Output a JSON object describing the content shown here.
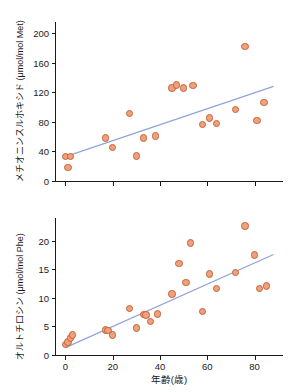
{
  "figure": {
    "background": "#ffffff",
    "marker_fill": "#f0a07a",
    "marker_edge": "#c4633a",
    "line_color": "#8fa5d8",
    "axis_color": "#1a1a1a"
  },
  "chart_data": [
    {
      "type": "scatter",
      "panel": "top",
      "title": "",
      "xlabel": "",
      "ylabel": "メチオニンスルホキシド (μmol/mol Met)",
      "xlim": [
        -4,
        92
      ],
      "ylim": [
        0,
        215
      ],
      "xticks": [
        0,
        20,
        40,
        60,
        80
      ],
      "xticklabels": [
        "",
        "",
        "",
        "",
        ""
      ],
      "yticks": [
        0,
        40,
        80,
        120,
        160,
        200
      ],
      "yticklabels": [
        "0",
        "40",
        "80",
        "120",
        "160",
        "200"
      ],
      "grid": false,
      "legend": "none",
      "x": [
        0,
        1,
        2,
        17,
        20,
        27,
        30,
        33,
        38,
        45,
        47,
        50,
        54,
        58,
        61,
        64,
        72,
        76,
        81,
        84
      ],
      "y": [
        33,
        18,
        33,
        58,
        45,
        91,
        34,
        58,
        61,
        126,
        130,
        126,
        129,
        76,
        85,
        78,
        97,
        182,
        82,
        106
      ],
      "fit_line": {
        "x": [
          0,
          88
        ],
        "y": [
          33,
          128
        ],
        "color": "#8fa5d8"
      }
    },
    {
      "type": "scatter",
      "panel": "bottom",
      "title": "",
      "xlabel": "年齢(歳)",
      "ylabel": "オルトチロシン (μmol/mol Phe)",
      "xlim": [
        -4,
        92
      ],
      "ylim": [
        0,
        24
      ],
      "xticks": [
        0,
        20,
        40,
        60,
        80
      ],
      "xticklabels": [
        "0",
        "20",
        "40",
        "60",
        "80"
      ],
      "yticks": [
        0,
        5,
        10,
        15,
        20
      ],
      "yticklabels": [
        "0",
        "5",
        "10",
        "15",
        "20"
      ],
      "grid": false,
      "legend": "none",
      "x": [
        0,
        1,
        2,
        3,
        17,
        18,
        20,
        27,
        30,
        33,
        34,
        36,
        39,
        45,
        48,
        51,
        53,
        58,
        61,
        64,
        72,
        76,
        80,
        82,
        85
      ],
      "y": [
        1.8,
        2.3,
        3.0,
        3.5,
        4.4,
        4.3,
        3.5,
        8.2,
        4.7,
        7.1,
        7.0,
        5.9,
        7.2,
        10.7,
        16.0,
        12.7,
        19.6,
        7.6,
        14.2,
        11.6,
        14.5,
        22.6,
        17.5,
        11.7,
        12.1
      ],
      "fit_line": {
        "x": [
          0,
          88
        ],
        "y": [
          1.3,
          17.6
        ],
        "color": "#8fa5d8"
      }
    }
  ]
}
